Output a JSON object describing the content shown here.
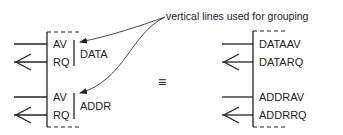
{
  "annotation": {
    "text": "vertical lines used for grouping"
  },
  "equivalence_symbol": "≡",
  "left_diagram": {
    "groups": [
      {
        "name": "DATA",
        "signals": [
          {
            "label": "AV",
            "direction": "out"
          },
          {
            "label": "RQ",
            "direction": "in"
          }
        ]
      },
      {
        "name": "ADDR",
        "signals": [
          {
            "label": "AV",
            "direction": "out"
          },
          {
            "label": "RQ",
            "direction": "in"
          }
        ]
      }
    ]
  },
  "right_diagram": {
    "signals": [
      {
        "label": "DATAAV",
        "direction": "out"
      },
      {
        "label": "DATARQ",
        "direction": "in"
      },
      {
        "label": "ADDRAV",
        "direction": "out"
      },
      {
        "label": "ADDRRQ",
        "direction": "in"
      }
    ]
  },
  "colors": {
    "stroke": "#222222",
    "background": "#ffffff"
  }
}
